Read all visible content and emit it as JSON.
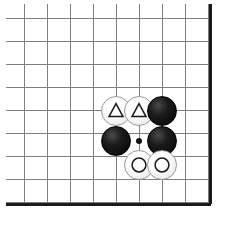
{
  "board": {
    "title": "Go board diagram",
    "columns": 9,
    "rows": 9,
    "grid_pitch_px": 23,
    "origin_x_px": 24,
    "origin_y_px": 18,
    "line_color": "#808080",
    "border_color": "#1a1a1a",
    "background_color": "#ffffff",
    "border_edges": [
      "right",
      "bottom"
    ],
    "border_width_px": 3,
    "line_width_px": 1
  },
  "stones": [
    {
      "id": "white-triangle-left",
      "color": "white",
      "color_hex": "#fbfbfb",
      "mark": "triangle",
      "mark_color": "#1a1a1a",
      "col": 4,
      "row": 4,
      "center_x": 116,
      "center_y": 111,
      "radius": 15
    },
    {
      "id": "white-triangle-right",
      "color": "white",
      "color_hex": "#fbfbfb",
      "mark": "triangle",
      "mark_color": "#1a1a1a",
      "col": 5,
      "row": 4,
      "center_x": 139,
      "center_y": 111,
      "radius": 15
    },
    {
      "id": "black-top-right",
      "color": "black",
      "color_hex": "#0a0a0a",
      "mark": "none",
      "mark_color": "",
      "col": 6,
      "row": 4,
      "center_x": 162,
      "center_y": 111,
      "radius": 15
    },
    {
      "id": "black-left",
      "color": "black",
      "color_hex": "#0a0a0a",
      "mark": "none",
      "mark_color": "",
      "col": 4,
      "row": 5,
      "center_x": 116,
      "center_y": 141,
      "radius": 15
    },
    {
      "id": "black-right",
      "color": "black",
      "color_hex": "#0a0a0a",
      "mark": "none",
      "mark_color": "",
      "col": 6,
      "row": 5,
      "center_x": 162,
      "center_y": 141,
      "radius": 15
    },
    {
      "id": "white-circle-left",
      "color": "white",
      "color_hex": "#fbfbfb",
      "mark": "circle",
      "mark_color": "#1a1a1a",
      "col": 5,
      "row": 6,
      "center_x": 139,
      "center_y": 165,
      "radius": 15
    },
    {
      "id": "white-circle-right",
      "color": "white",
      "color_hex": "#fbfbfb",
      "mark": "circle",
      "mark_color": "#1a1a1a",
      "col": 6,
      "row": 6,
      "center_x": 162,
      "center_y": 165,
      "radius": 15
    }
  ],
  "empty_points": [
    {
      "id": "marked-empty-point",
      "col": 5,
      "row": 5,
      "center_x": 139,
      "center_y": 141,
      "dot_radius": 3,
      "dot_color": "#111111"
    }
  ]
}
